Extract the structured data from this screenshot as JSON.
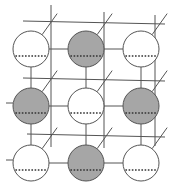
{
  "diagram": {
    "title": "",
    "colors": {
      "background": "#ffffff",
      "line": "#555555",
      "shaded_fill": "#a6a6a6",
      "empty_fill": "#ffffff",
      "dotted": "#333333"
    },
    "radius": 18,
    "nodes": [
      {
        "row": 0,
        "col": 0,
        "cx": 31,
        "cy": 49,
        "shaded": false
      },
      {
        "row": 0,
        "col": 1,
        "cx": 86,
        "cy": 49,
        "shaded": true
      },
      {
        "row": 0,
        "col": 2,
        "cx": 141,
        "cy": 49,
        "shaded": false
      },
      {
        "row": 1,
        "col": 0,
        "cx": 31,
        "cy": 106,
        "shaded": true
      },
      {
        "row": 1,
        "col": 1,
        "cx": 86,
        "cy": 106,
        "shaded": false
      },
      {
        "row": 1,
        "col": 2,
        "cx": 141,
        "cy": 106,
        "shaded": true
      },
      {
        "row": 2,
        "col": 0,
        "cx": 31,
        "cy": 163,
        "shaded": false
      },
      {
        "row": 2,
        "col": 1,
        "cx": 86,
        "cy": 163,
        "shaded": true
      },
      {
        "row": 2,
        "col": 2,
        "cx": 141,
        "cy": 163,
        "shaded": false
      }
    ],
    "back_grid": {
      "horizontal": [
        {
          "x1": 23,
          "y1": 21,
          "x2": 165,
          "y2": 24
        },
        {
          "x1": 23,
          "y1": 78,
          "x2": 165,
          "y2": 81
        },
        {
          "x1": 27,
          "y1": 134,
          "x2": 165,
          "y2": 137
        }
      ],
      "vertical": [
        {
          "x1": 51,
          "y1": 5,
          "x2": 51,
          "y2": 147
        },
        {
          "x1": 104,
          "y1": 12,
          "x2": 104,
          "y2": 148
        },
        {
          "x1": 155,
          "y1": 15,
          "x2": 155,
          "y2": 146
        }
      ]
    },
    "diagonals_per_node": {
      "dx": 15,
      "dy": -21
    }
  }
}
